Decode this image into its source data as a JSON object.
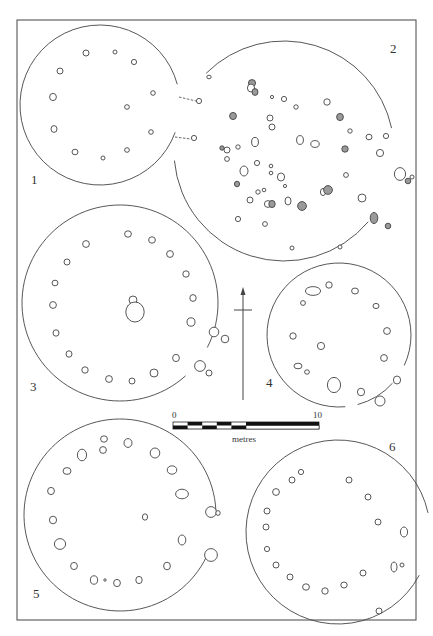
{
  "figure": {
    "frame": {
      "x": 17,
      "y": 20,
      "w": 399,
      "h": 600
    },
    "stroke_color": "#444444",
    "fill_shaded": "#9a9a9a"
  },
  "plans": [
    {
      "id": "1",
      "label": "1",
      "label_pos": [
        31,
        183
      ],
      "outline": {
        "cx": 100,
        "cy": 105,
        "r": 80,
        "gap_from_deg": -15,
        "gap_to_deg": 20
      },
      "entrance_lines": [
        [
          179,
          97,
          196,
          101
        ],
        [
          175,
          137,
          191,
          139
        ]
      ],
      "postholes": [
        [
          86,
          53,
          3,
          3,
          0
        ],
        [
          115,
          52,
          2,
          2,
          0
        ],
        [
          134,
          62,
          2.6,
          2.6,
          0
        ],
        [
          60,
          71,
          3,
          3,
          0
        ],
        [
          53,
          97,
          3.4,
          3.6,
          0
        ],
        [
          153,
          93,
          2.3,
          2.3,
          0
        ],
        [
          127,
          107,
          2.4,
          2.3,
          0
        ],
        [
          54,
          129,
          3,
          3.4,
          0
        ],
        [
          151,
          132,
          2.3,
          2.3,
          0
        ],
        [
          75,
          152,
          3,
          2.8,
          0
        ],
        [
          103,
          158,
          2,
          2,
          0
        ],
        [
          127,
          150,
          2.4,
          2.3,
          0
        ],
        [
          199,
          101,
          2.6,
          2.6,
          0
        ],
        [
          194,
          138,
          2.6,
          2.6,
          0
        ]
      ]
    },
    {
      "id": "2",
      "label": "2",
      "label_pos": [
        390,
        52
      ],
      "outline": {
        "cx": 284,
        "cy": 151,
        "r": 110,
        "gap_from_deg": -12,
        "gap_to_deg": 40,
        "gap2_from_deg": 175,
        "gap2_to_deg": 225
      },
      "postholes": [
        [
          209,
          77,
          2.2,
          1.8,
          0
        ],
        [
          252,
          83,
          3.6,
          3.4,
          1
        ],
        [
          251,
          88,
          3.6,
          4,
          0
        ],
        [
          255,
          92,
          3,
          3.4,
          1
        ],
        [
          272,
          97,
          1.6,
          1.6,
          0
        ],
        [
          284,
          99,
          2.6,
          2.6,
          0
        ],
        [
          296,
          107,
          2.2,
          2.2,
          0
        ],
        [
          327,
          102,
          3.2,
          3.2,
          0
        ],
        [
          233,
          116,
          3.4,
          3.6,
          1
        ],
        [
          270,
          118,
          3,
          3,
          0
        ],
        [
          272,
          127,
          3,
          3,
          0
        ],
        [
          340,
          117,
          3.4,
          3.6,
          1
        ],
        [
          350,
          131,
          2.2,
          2.2,
          0
        ],
        [
          369,
          137,
          3,
          2.8,
          0
        ],
        [
          386,
          136,
          2.6,
          2.6,
          0
        ],
        [
          255,
          142,
          3.4,
          4.6,
          0
        ],
        [
          300,
          140,
          3.4,
          4.4,
          0
        ],
        [
          315,
          144,
          4.2,
          3.4,
          0
        ],
        [
          222,
          148,
          2.2,
          2.2,
          1
        ],
        [
          227,
          150,
          3,
          3,
          0
        ],
        [
          238,
          147,
          2.2,
          2.2,
          0
        ],
        [
          345,
          149,
          3.2,
          3.2,
          1
        ],
        [
          380,
          153,
          3.6,
          3.6,
          0
        ],
        [
          227,
          159,
          2.4,
          2.4,
          0
        ],
        [
          244,
          171,
          4,
          5,
          0
        ],
        [
          257,
          163,
          2.6,
          2.6,
          0
        ],
        [
          271,
          166,
          1.8,
          1.8,
          0
        ],
        [
          271,
          173,
          1.8,
          1.8,
          0
        ],
        [
          281,
          177,
          3.6,
          4,
          0
        ],
        [
          285,
          186,
          1.6,
          1.6,
          0
        ],
        [
          346,
          175,
          2.4,
          2.4,
          0
        ],
        [
          400,
          174,
          5.6,
          6.4,
          0
        ],
        [
          408,
          181,
          2.8,
          2.8,
          1
        ],
        [
          412,
          177,
          2,
          2,
          0
        ],
        [
          237,
          184,
          2.6,
          2.8,
          1
        ],
        [
          258,
          192,
          2.2,
          2.2,
          0
        ],
        [
          264,
          190,
          1.8,
          1.8,
          0
        ],
        [
          250,
          200,
          3,
          3,
          0
        ],
        [
          268,
          204,
          3.6,
          3.4,
          0
        ],
        [
          272,
          204,
          3.2,
          3.6,
          1
        ],
        [
          288,
          201,
          3,
          4,
          0
        ],
        [
          302,
          206,
          4.4,
          4.4,
          1
        ],
        [
          323,
          192,
          2.6,
          3.6,
          0
        ],
        [
          328,
          190,
          4.4,
          4.4,
          1
        ],
        [
          362,
          198,
          4,
          4,
          0
        ],
        [
          374,
          218,
          3.8,
          5.6,
          1
        ],
        [
          388,
          226,
          2.8,
          2.8,
          1
        ],
        [
          238,
          219,
          2.6,
          2.6,
          0
        ],
        [
          265,
          224,
          2.4,
          2.4,
          0
        ],
        [
          292,
          248,
          2,
          2,
          0
        ],
        [
          340,
          247,
          2,
          2,
          0
        ]
      ]
    },
    {
      "id": "3",
      "label": "3",
      "label_pos": [
        30,
        390
      ],
      "outline": {
        "cx": 120,
        "cy": 303,
        "r": 98,
        "gap_from_deg": 27,
        "gap_to_deg": 48
      },
      "postholes": [
        [
          128,
          234,
          3.4,
          3.2,
          0
        ],
        [
          152,
          240,
          3.4,
          3.2,
          0
        ],
        [
          86,
          244,
          3.4,
          3.4,
          0
        ],
        [
          170,
          254,
          3.4,
          3.4,
          0
        ],
        [
          67,
          262,
          3,
          3,
          0
        ],
        [
          186,
          274,
          3.2,
          3.2,
          0
        ],
        [
          55,
          283,
          3,
          2.8,
          0
        ],
        [
          133,
          300,
          4,
          4,
          0
        ],
        [
          135,
          312,
          9.2,
          10,
          0
        ],
        [
          53,
          305,
          3.4,
          3.4,
          0
        ],
        [
          193,
          298,
          3.2,
          3.4,
          0
        ],
        [
          191,
          322,
          4,
          4.2,
          0
        ],
        [
          214,
          332,
          4.8,
          4.8,
          0
        ],
        [
          225,
          339,
          3.8,
          3.8,
          0
        ],
        [
          56,
          333,
          3,
          3.2,
          0
        ],
        [
          69,
          354,
          3,
          3.2,
          0
        ],
        [
          176,
          358,
          3.4,
          3.6,
          0
        ],
        [
          85,
          370,
          3.2,
          3.2,
          0
        ],
        [
          109,
          379,
          3.4,
          3.4,
          0
        ],
        [
          132,
          381,
          3,
          3,
          0
        ],
        [
          154,
          373,
          4,
          4,
          0
        ],
        [
          200,
          366,
          5.4,
          5.4,
          0
        ],
        [
          209,
          373,
          3,
          3,
          0
        ]
      ]
    },
    {
      "id": "4",
      "label": "4",
      "label_pos": [
        266,
        386
      ],
      "outline": {
        "cx": 339,
        "cy": 335,
        "r": 72,
        "gap_from_deg": 25,
        "gap_to_deg": 42,
        "gap2_from_deg": 75,
        "gap2_to_deg": 85
      },
      "postholes": [
        [
          313,
          291,
          7.6,
          4.4,
          0
        ],
        [
          329,
          285,
          3.2,
          3.2,
          0
        ],
        [
          355,
          291,
          3.4,
          3,
          0
        ],
        [
          303,
          303,
          2.4,
          2.4,
          0
        ],
        [
          376,
          306,
          3,
          2.6,
          0
        ],
        [
          387,
          331,
          3.4,
          3.4,
          0
        ],
        [
          293,
          336,
          3.2,
          3.2,
          0
        ],
        [
          321,
          346,
          3.6,
          3.6,
          0
        ],
        [
          384,
          358,
          3.4,
          3.4,
          0
        ],
        [
          298,
          366,
          4,
          2.8,
          0
        ],
        [
          307,
          372,
          2.4,
          2.2,
          0
        ],
        [
          334,
          385,
          6.6,
          7.6,
          0
        ],
        [
          361,
          392,
          3.6,
          3.8,
          0
        ],
        [
          397,
          380,
          3.6,
          4,
          0
        ],
        [
          380,
          401,
          5,
          5,
          0
        ]
      ]
    },
    {
      "id": "5",
      "label": "5",
      "label_pos": [
        33,
        597
      ],
      "outline": {
        "cx": 120,
        "cy": 515,
        "r": 96,
        "gap_from_deg": -3,
        "gap_to_deg": 22
      },
      "postholes": [
        [
          104,
          439,
          3.4,
          3.2,
          0
        ],
        [
          103,
          450,
          3.4,
          3.4,
          0
        ],
        [
          128,
          443,
          4,
          4.4,
          0
        ],
        [
          82,
          455,
          4.6,
          5.8,
          0
        ],
        [
          155,
          453,
          4.8,
          5,
          0
        ],
        [
          67,
          471,
          4,
          3.4,
          0
        ],
        [
          172,
          470,
          4.8,
          4.2,
          0
        ],
        [
          51,
          491,
          3.4,
          3.6,
          0
        ],
        [
          182,
          494,
          6.4,
          4.8,
          0
        ],
        [
          53,
          520,
          3.6,
          3.8,
          0
        ],
        [
          145,
          517,
          2.6,
          3.2,
          0
        ],
        [
          211,
          512,
          5.4,
          5.4,
          0
        ],
        [
          218,
          513,
          2.2,
          2.4,
          0
        ],
        [
          60,
          544,
          5.6,
          5.4,
          0
        ],
        [
          182,
          540,
          3.8,
          5,
          0
        ],
        [
          211,
          555,
          6.4,
          6.4,
          0
        ],
        [
          74,
          566,
          3.4,
          3.6,
          0
        ],
        [
          167,
          566,
          3.4,
          3.8,
          0
        ],
        [
          94,
          580,
          3.6,
          4.2,
          0
        ],
        [
          105,
          580,
          1.2,
          1.2,
          0
        ],
        [
          117,
          583,
          3.4,
          3.6,
          0
        ],
        [
          139,
          580,
          3.2,
          3.6,
          0
        ]
      ]
    },
    {
      "id": "6",
      "label": "6",
      "label_pos": [
        389,
        450
      ],
      "outline": {
        "cx": 338,
        "cy": 532,
        "r": 92,
        "gap_from_deg": -12,
        "gap_to_deg": 28
      },
      "postholes": [
        [
          301,
          472,
          2.6,
          2.6,
          0
        ],
        [
          292,
          480,
          3,
          3,
          0
        ],
        [
          349,
          480,
          3,
          3,
          0
        ],
        [
          276,
          492,
          3.4,
          3.4,
          0
        ],
        [
          368,
          497,
          3,
          3,
          0
        ],
        [
          267,
          511,
          3,
          3,
          0
        ],
        [
          378,
          522,
          3,
          3,
          0
        ],
        [
          266,
          527,
          3,
          3,
          0
        ],
        [
          404,
          532,
          3.6,
          5,
          0
        ],
        [
          267,
          549,
          2.6,
          2.6,
          0
        ],
        [
          276,
          565,
          3,
          3,
          0
        ],
        [
          394,
          567,
          3,
          5,
          0
        ],
        [
          402,
          565,
          2,
          2,
          0
        ],
        [
          363,
          573,
          3,
          3,
          0
        ],
        [
          290,
          577,
          3,
          3,
          0
        ],
        [
          306,
          587,
          3.4,
          3.2,
          0
        ],
        [
          325,
          591,
          3.2,
          3.2,
          0
        ],
        [
          344,
          585,
          3.2,
          3,
          0
        ],
        [
          379,
          611,
          3,
          3,
          0
        ]
      ]
    }
  ],
  "north_arrow": {
    "x": 243,
    "y_top": 287,
    "y_bottom": 400,
    "cross_y": 310,
    "cross_half": 9
  },
  "scale_bar": {
    "x": 173,
    "y": 422,
    "w": 146,
    "h": 7,
    "segments": 10,
    "label_start": "0",
    "label_end": "10",
    "unit_label": "metres",
    "label_start_pos": [
      172,
      411
    ],
    "label_end_pos": [
      313,
      411
    ],
    "unit_pos": [
      232,
      435
    ]
  }
}
